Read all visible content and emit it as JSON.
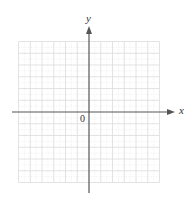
{
  "diagram": {
    "type": "coordinate-grid",
    "axes": {
      "x_label": "x",
      "y_label": "y",
      "origin_label": "0"
    },
    "grid": {
      "cells_x": 12,
      "cells_y": 12,
      "cells_per_quadrant": 6,
      "minor_subdivisions": 2
    },
    "colors": {
      "axis": "#555555",
      "grid_major": "#dcdcdc",
      "grid_minor": "#ececec",
      "label": "#333333"
    }
  }
}
